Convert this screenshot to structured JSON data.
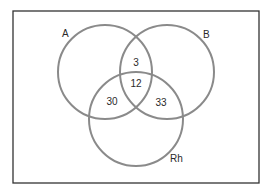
{
  "diagram": {
    "type": "venn",
    "sets": [
      {
        "name": "A",
        "label": "A"
      },
      {
        "name": "B",
        "label": "B"
      },
      {
        "name": "Rh",
        "label": "Rh"
      }
    ],
    "regions": {
      "A_and_B_only": "3",
      "A_and_B_and_Rh": "12",
      "A_and_Rh_only": "30",
      "B_and_Rh_only": "33"
    },
    "colors": {
      "circle_stroke": "#8a8a8a",
      "frame_stroke": "#333333",
      "text": "#2a2a2a"
    }
  }
}
